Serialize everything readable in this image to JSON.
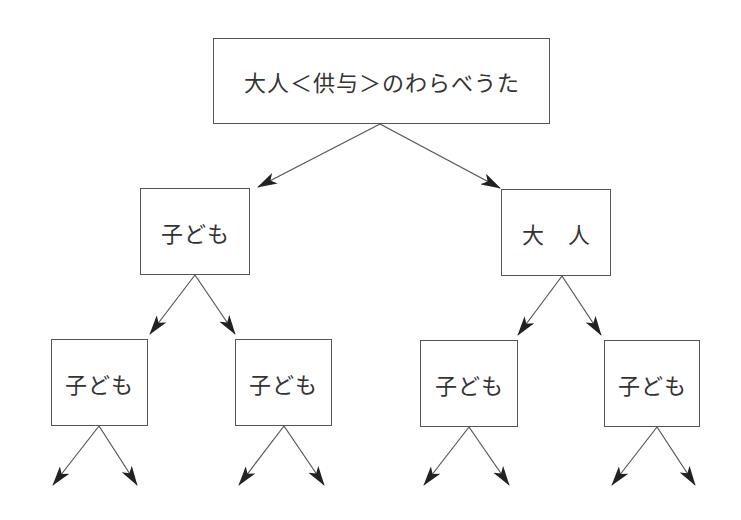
{
  "diagram": {
    "type": "tree",
    "root": {
      "label": "大人＜供与＞のわらべうた"
    },
    "level1": [
      {
        "label": "子ども"
      },
      {
        "label": "大　人"
      }
    ],
    "level2": [
      {
        "label": "子ども",
        "parent": 0
      },
      {
        "label": "子ども",
        "parent": 0
      },
      {
        "label": "子ども",
        "parent": 1
      },
      {
        "label": "子ども",
        "parent": 1
      }
    ],
    "colors": {
      "line": "#555555",
      "arrowhead": "#222222",
      "text": "#333333",
      "background": "#ffffff"
    }
  }
}
